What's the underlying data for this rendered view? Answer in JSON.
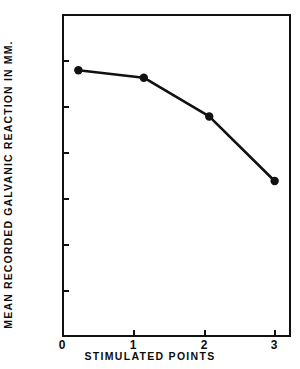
{
  "chart_data": {
    "type": "line",
    "title": "",
    "xlabel": "STIMULATED POINTS",
    "ylabel": "MEAN RECORDED GALVANIC REACTION IN MM.",
    "x": [
      0,
      1,
      2,
      3
    ],
    "values": [
      5.78,
      5.62,
      4.78,
      3.38
    ],
    "categories": [
      "0",
      "1",
      "2",
      "3"
    ],
    "xtick_labels": [
      "0",
      "1",
      "2",
      "3"
    ],
    "ytick_labels": [
      "0",
      "1",
      "2",
      "3",
      "4",
      "5",
      "6",
      "7"
    ],
    "ytick_values": [
      0,
      1,
      2,
      3,
      4,
      5,
      6,
      7
    ],
    "xlim": [
      -0.25,
      3.25
    ],
    "ylim": [
      0,
      7
    ],
    "grid": false,
    "legend": false,
    "legend_position": "none",
    "marker": "filled-circle",
    "line_color": "#111111",
    "marker_color": "#111111",
    "background_color": "#ffffff",
    "series": [
      {
        "name": "mean galvanic reaction",
        "values": [
          5.78,
          5.62,
          4.78,
          3.38
        ]
      }
    ]
  }
}
